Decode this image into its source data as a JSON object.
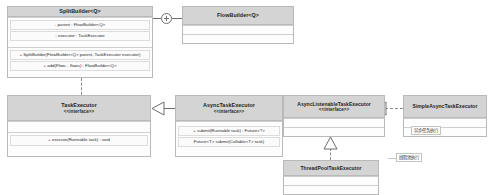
{
  "diagram": {
    "background": "#ffffff",
    "header_fill": "#d4d4d4",
    "body_fill": "#fdfdfd",
    "border_color": "#b9b9b9",
    "line_color": "#6e6e6e"
  },
  "classes": {
    "split_builder": {
      "name": "SplitBuilder<Q>",
      "stereotype": "",
      "attributes": [
        "- parent : FlowBuilder<Q>",
        "- executor : TaskExecutor"
      ],
      "methods": [
        "+ SplitBuilder(FlowBuilder<Q> parent, TaskExecutor executor)",
        "+ add(Flow... flows) : FlowBuilder<Q>"
      ]
    },
    "flow_builder": {
      "name": "FlowBuilder<Q>",
      "stereotype": "",
      "attributes": [],
      "methods": []
    },
    "task_executor": {
      "name": "TaskExecutor",
      "stereotype": "<<interface>>",
      "attributes": [],
      "methods": [
        "+ execute(Runnable task) : void"
      ]
    },
    "async_task_executor": {
      "name": "AsyncTaskExecutor",
      "stereotype": "<<interface>>",
      "attributes": [],
      "methods": [
        "+ submit(Runnable task) : Future<?>",
        "Future<T> submit(Callable<T> task)"
      ]
    },
    "async_listenable_task_executor": {
      "name": "AsyncListenableTaskExecutor",
      "stereotype": "<<interface>>",
      "attributes": [],
      "methods": []
    },
    "simple_async_task_executor": {
      "name": "SimpleAsyncTaskExecutor",
      "stereotype": "",
      "attributes": [],
      "methods": []
    },
    "thread_pool_task_executor": {
      "name": "ThreadPoolTaskExecutor",
      "stereotype": "",
      "attributes": [],
      "methods": []
    }
  },
  "notes": {
    "simple_async_note": "异步任务执行",
    "thread_pool_note": "线程池执行"
  },
  "connectors": {
    "junction_label": "plus-junction",
    "split_to_flow": "association",
    "split_to_task_executor": "dependency",
    "async_to_task_executor": "generalization",
    "listenable_to_async": "generalization",
    "simple_to_listenable": "realization",
    "threadpool_to_listenable": "realization"
  }
}
